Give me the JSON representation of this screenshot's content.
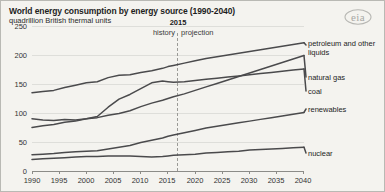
{
  "chart_data": {
    "type": "line",
    "title": "World energy consumption by energy source (1990-2040)",
    "subtitle": "quadrillion British thermal units",
    "ylabel": "quadrillion British thermal units",
    "xlabel": "",
    "ylim": [
      0,
      250
    ],
    "xlim": [
      1990,
      2040
    ],
    "grid": true,
    "legend_position": "right-inline",
    "source_logo": "eia",
    "yticks": [
      0,
      50,
      100,
      150,
      200,
      250
    ],
    "xticks": [
      1990,
      1995,
      2000,
      2005,
      2010,
      2015,
      2020,
      2025,
      2030,
      2035,
      2040
    ],
    "annotations": {
      "divider_year": "2015",
      "left_region": "history",
      "right_region": "projection"
    },
    "x": [
      1990,
      1992,
      1994,
      1996,
      1998,
      2000,
      2002,
      2004,
      2006,
      2008,
      2010,
      2012,
      2014,
      2015,
      2016,
      2018,
      2020,
      2022,
      2024,
      2026,
      2028,
      2030,
      2032,
      2034,
      2036,
      2038,
      2040
    ],
    "series": [
      {
        "name": "petroleum and other liquids",
        "values": [
          135,
          137,
          139,
          144,
          148,
          152,
          154,
          161,
          165,
          166,
          170,
          173,
          177,
          180,
          182,
          186,
          190,
          194,
          197,
          200,
          203,
          206,
          209,
          212,
          215,
          218,
          221
        ]
      },
      {
        "name": "natural gas",
        "values": [
          75,
          78,
          80,
          84,
          86,
          90,
          92,
          96,
          99,
          104,
          111,
          117,
          122,
          125,
          128,
          133,
          139,
          145,
          151,
          157,
          163,
          169,
          175,
          181,
          187,
          193,
          199
        ]
      },
      {
        "name": "coal",
        "values": [
          90,
          88,
          87,
          89,
          88,
          90,
          94,
          110,
          124,
          132,
          142,
          152,
          155,
          154,
          153,
          154,
          156,
          158,
          160,
          162,
          164,
          166,
          168,
          170,
          172,
          174,
          176
        ]
      },
      {
        "name": "renewables",
        "values": [
          28,
          29,
          30,
          32,
          33,
          34,
          35,
          38,
          41,
          44,
          49,
          53,
          57,
          60,
          62,
          66,
          70,
          74,
          77,
          80,
          83,
          86,
          89,
          92,
          95,
          98,
          101
        ]
      },
      {
        "name": "nuclear",
        "values": [
          20,
          21,
          22,
          23,
          24,
          25,
          25,
          26,
          26,
          26,
          25,
          24,
          25,
          26,
          27,
          28,
          29,
          31,
          32,
          33,
          34,
          36,
          37,
          38,
          39,
          40,
          41
        ]
      }
    ]
  },
  "axis": {
    "yticks": [
      "250",
      "200",
      "150",
      "100",
      "50",
      "0"
    ],
    "xticks": [
      "1990",
      "1995",
      "2000",
      "2005",
      "2010",
      "2015",
      "2020",
      "2025",
      "2030",
      "2035",
      "2040"
    ]
  },
  "labels": {
    "petroleum": "petroleum and other liquids",
    "natural_gas": "natural gas",
    "coal": "coal",
    "renewables": "renewables",
    "nuclear": "nuclear",
    "history": "history",
    "projection": "projection",
    "divider_year": "2015"
  },
  "logo": {
    "text": "eia"
  },
  "colors": {
    "background": "#f4f3ef",
    "line": "#4a4a4c",
    "grid": "#dededa",
    "axis": "#8c8c88",
    "logo": "#a8a8a4"
  }
}
